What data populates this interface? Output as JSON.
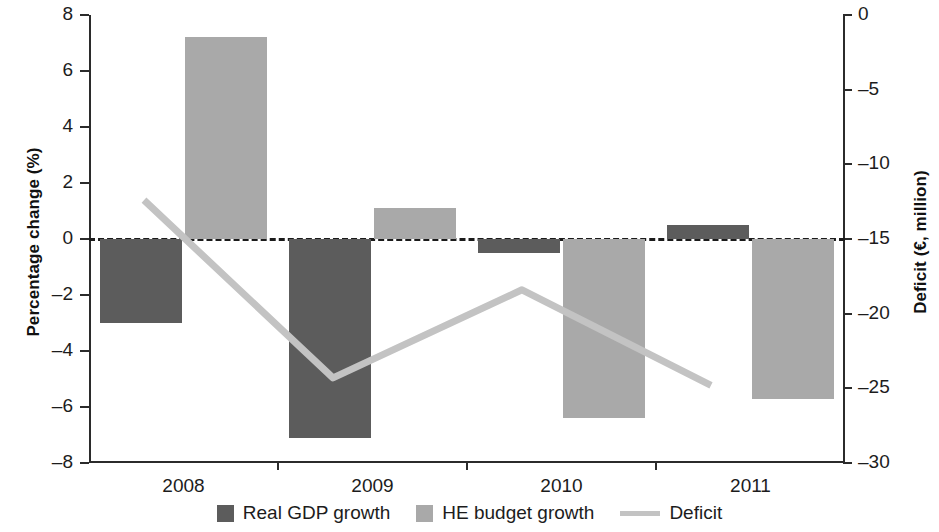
{
  "chart_data": {
    "type": "bar",
    "title": "",
    "subtitle": "",
    "xlabel": "",
    "categories": [
      "2008",
      "2009",
      "2010",
      "2011"
    ],
    "grid": false,
    "legend_position": "bottom",
    "zero_reference_line": true,
    "left_axis": {
      "label": "Percentage change (%)",
      "ylim": [
        -8,
        8
      ],
      "tick_step": 2,
      "ticks": [
        "8",
        "6",
        "4",
        "2",
        "0",
        "–2",
        "–4",
        "–6",
        "–8"
      ],
      "tick_values": [
        8,
        6,
        4,
        2,
        0,
        -2,
        -4,
        -6,
        -8
      ]
    },
    "right_axis": {
      "label": "Deficit (€, million)",
      "ylim": [
        -30,
        0
      ],
      "tick_step": 5,
      "ticks": [
        "0",
        "–5",
        "–10",
        "–15",
        "–20",
        "–25",
        "–30"
      ],
      "tick_values": [
        0,
        -5,
        -10,
        -15,
        -20,
        -25,
        -30
      ]
    },
    "series": [
      {
        "name": "Real GDP growth",
        "type": "bar",
        "axis": "left",
        "color": "#5c5c5c",
        "values": [
          -3.0,
          -7.1,
          -0.5,
          0.5
        ]
      },
      {
        "name": "HE budget growth",
        "type": "bar",
        "axis": "left",
        "color": "#a9a9a9",
        "values": [
          7.2,
          1.1,
          -6.4,
          -5.7
        ]
      },
      {
        "name": "Deficit",
        "type": "line",
        "axis": "right",
        "color": "#c3c3c3",
        "values": [
          -12.4,
          -24.3,
          -18.4,
          -24.8
        ]
      }
    ]
  },
  "legend": {
    "items": [
      {
        "label": "Real GDP growth",
        "marker": "swatch",
        "color": "#5c5c5c"
      },
      {
        "label": "HE budget growth",
        "marker": "swatch",
        "color": "#a9a9a9"
      },
      {
        "label": "Deficit",
        "marker": "line",
        "color": "#c3c3c3"
      }
    ]
  }
}
